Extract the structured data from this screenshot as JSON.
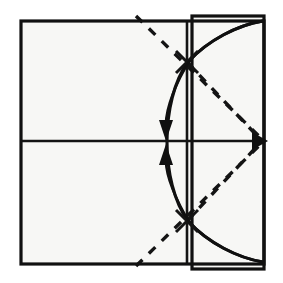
{
  "diagram": {
    "title": "Origami fold step diagram",
    "type": "origami-fold-instruction",
    "canvas": {
      "width": 283,
      "height": 283,
      "background": "#ffffff"
    },
    "colors": {
      "paper_fill": "#f7f7f5",
      "edge_line": "#111111",
      "crease_line": "#141414",
      "dashed_line": "#141414",
      "arrow": "#101010"
    },
    "shapes": {
      "main_square": {
        "name": "paper-square",
        "x": 21,
        "y": 21,
        "width": 243,
        "height": 243,
        "line_style": "solid"
      },
      "flap_rectangle": {
        "name": "folded-flap",
        "x": 192,
        "y": 16,
        "width": 72,
        "height": 253,
        "line_style": "solid"
      }
    },
    "creases": [
      {
        "name": "horizontal-midline",
        "x1": 21,
        "y1": 141,
        "x2": 264,
        "y2": 141,
        "style": "solid"
      },
      {
        "name": "vertical-fold-line",
        "x1": 187,
        "y1": 21,
        "x2": 187,
        "y2": 264,
        "style": "solid"
      }
    ],
    "dashed_lines": [
      {
        "name": "upper-diagonal-crease",
        "x1": 136,
        "y1": 16,
        "x2": 264,
        "y2": 141
      },
      {
        "name": "lower-diagonal-crease",
        "x1": 136,
        "y1": 266,
        "x2": 264,
        "y2": 141
      }
    ],
    "arcs": [
      {
        "name": "upper-arc",
        "from": [
          264,
          21
        ],
        "to": [
          187,
          62
        ],
        "control": [
          212,
          26
        ]
      },
      {
        "name": "mid-upper-arc",
        "from": [
          187,
          62
        ],
        "to": [
          187,
          221
        ],
        "bulge": "left"
      },
      {
        "name": "lower-arc",
        "from": [
          187,
          221
        ],
        "to": [
          264,
          262
        ],
        "control": [
          212,
          258
        ]
      }
    ],
    "arrows": [
      {
        "name": "fold-arrow-down",
        "direction": "down",
        "tip": [
          168,
          140
        ],
        "label": "valley fold down"
      },
      {
        "name": "fold-arrow-up",
        "direction": "up",
        "tip": [
          168,
          144
        ],
        "label": "valley fold up"
      },
      {
        "name": "right-edge-arrow",
        "direction": "right",
        "tip": [
          266,
          141
        ],
        "label": "align to right edge"
      }
    ],
    "intersection_points": [
      {
        "name": "upper-intersection",
        "x": 187,
        "y": 62
      },
      {
        "name": "lower-intersection",
        "x": 187,
        "y": 221
      },
      {
        "name": "right-midpoint",
        "x": 264,
        "y": 141
      }
    ]
  }
}
